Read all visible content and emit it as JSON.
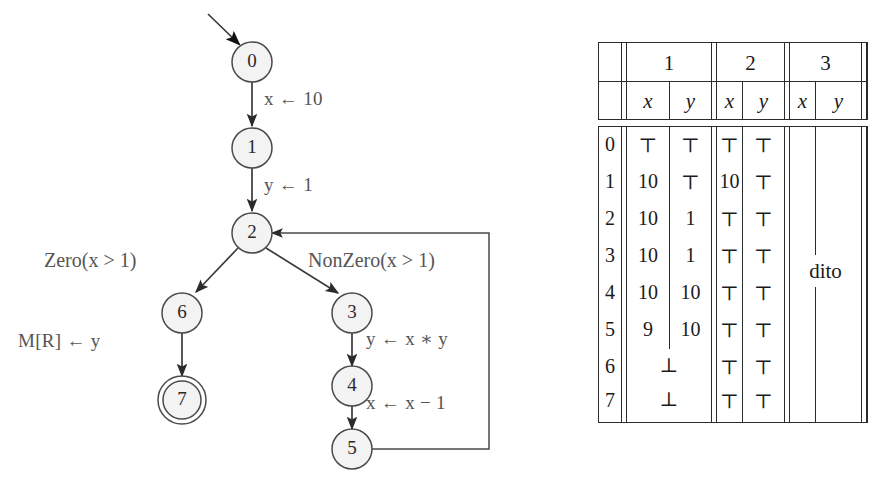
{
  "figure": {
    "kind": "control-flow-graph-with-analysis-table"
  },
  "graph": {
    "nodes": [
      {
        "id": "0",
        "label": "0",
        "cx": 252,
        "cy": 62,
        "accepting": false
      },
      {
        "id": "1",
        "label": "1",
        "cx": 252,
        "cy": 148,
        "accepting": false
      },
      {
        "id": "2",
        "label": "2",
        "cx": 252,
        "cy": 233,
        "accepting": false
      },
      {
        "id": "6",
        "label": "6",
        "cx": 182,
        "cy": 313,
        "accepting": false
      },
      {
        "id": "3",
        "label": "3",
        "cx": 352,
        "cy": 313,
        "accepting": false
      },
      {
        "id": "7",
        "label": "7",
        "cx": 182,
        "cy": 400,
        "accepting": true
      },
      {
        "id": "4",
        "label": "4",
        "cx": 352,
        "cy": 386,
        "accepting": false
      },
      {
        "id": "5",
        "label": "5",
        "cx": 352,
        "cy": 449,
        "accepting": false
      }
    ],
    "edge_labels": {
      "e01": "x ← 10",
      "e12": "y ← 1",
      "e26": "Zero(x > 1)",
      "e23": "NonZero(x > 1)",
      "e67": "M[R] ← y",
      "e34": "y ← x ∗ y",
      "e45": "x ← x − 1"
    },
    "entry_arrow": "entry-arrow",
    "back_edge": "5-to-2-loop-back"
  },
  "table": {
    "group_headers": [
      "1",
      "2",
      "3"
    ],
    "var_headers": [
      "x",
      "y"
    ],
    "row_labels": [
      "0",
      "1",
      "2",
      "3",
      "4",
      "5",
      "6",
      "7"
    ],
    "col1": {
      "x": [
        "⊤",
        "10",
        "10",
        "10",
        "10",
        "9",
        null,
        null
      ],
      "y": [
        "⊤",
        "⊤",
        "1",
        "1",
        "10",
        "10",
        null,
        null
      ],
      "merged": {
        "6": "⊥",
        "7": "⊥"
      }
    },
    "col2": {
      "x": [
        "⊤",
        "10",
        "⊤",
        "⊤",
        "⊤",
        "⊤",
        "⊤",
        "⊤"
      ],
      "y": [
        "⊤",
        "⊤",
        "⊤",
        "⊤",
        "⊤",
        "⊤",
        "⊤",
        "⊤"
      ]
    },
    "col3": {
      "x": [
        "",
        "",
        "",
        "",
        "",
        "",
        "",
        ""
      ],
      "y": [
        "",
        "",
        "",
        "",
        "",
        "",
        "",
        ""
      ],
      "note": "dito"
    }
  }
}
